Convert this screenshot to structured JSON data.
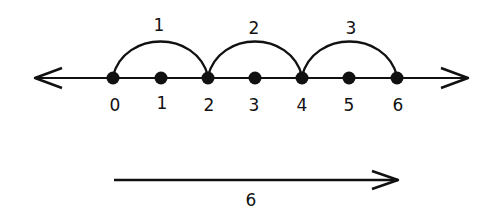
{
  "diagram": {
    "type": "number-line-skip-counting",
    "number_line": {
      "ticks": [
        {
          "value": "0",
          "x": 113
        },
        {
          "value": "1",
          "x": 161
        },
        {
          "value": "2",
          "x": 208
        },
        {
          "value": "3",
          "x": 255
        },
        {
          "value": "4",
          "x": 302
        },
        {
          "value": "5",
          "x": 349
        },
        {
          "value": "6",
          "x": 397
        }
      ]
    },
    "jumps": [
      {
        "label": "1",
        "from": "0",
        "to": "2"
      },
      {
        "label": "2",
        "from": "2",
        "to": "4"
      },
      {
        "label": "3",
        "from": "4",
        "to": "6"
      }
    ],
    "total_arrow": {
      "label": "6"
    },
    "colors": {
      "ink": "#111111",
      "background": "#ffffff"
    }
  }
}
